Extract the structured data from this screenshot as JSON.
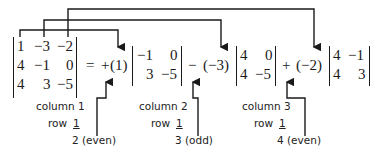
{
  "figure": {
    "matrix": {
      "rows": [
        [
          "1",
          "−3",
          "−2"
        ],
        [
          "4",
          "−1",
          "0"
        ],
        [
          "4",
          "3",
          "−5"
        ]
      ]
    },
    "equals": "=",
    "terms": [
      {
        "sign": "+",
        "coefficient": "(1)",
        "minor": [
          [
            "−1",
            "0"
          ],
          [
            "3",
            "−5"
          ]
        ],
        "label_column": "column 1",
        "label_row": "row",
        "label_row_num": "1",
        "label_sum": "2 (even)"
      },
      {
        "sign": "−",
        "coefficient": "(−3)",
        "minor": [
          [
            "4",
            "0"
          ],
          [
            "4",
            "−5"
          ]
        ],
        "label_column": "column 2",
        "label_row": "row",
        "label_row_num": "1",
        "label_sum": "3 (odd)"
      },
      {
        "sign": "+",
        "coefficient": "(−2)",
        "minor": [
          [
            "4",
            "−1"
          ],
          [
            "4",
            "3"
          ]
        ],
        "label_column": "column 3",
        "label_row": "row",
        "label_row_num": "1",
        "label_sum": "4 (even)"
      }
    ],
    "line_color": "#1a1a1a"
  }
}
